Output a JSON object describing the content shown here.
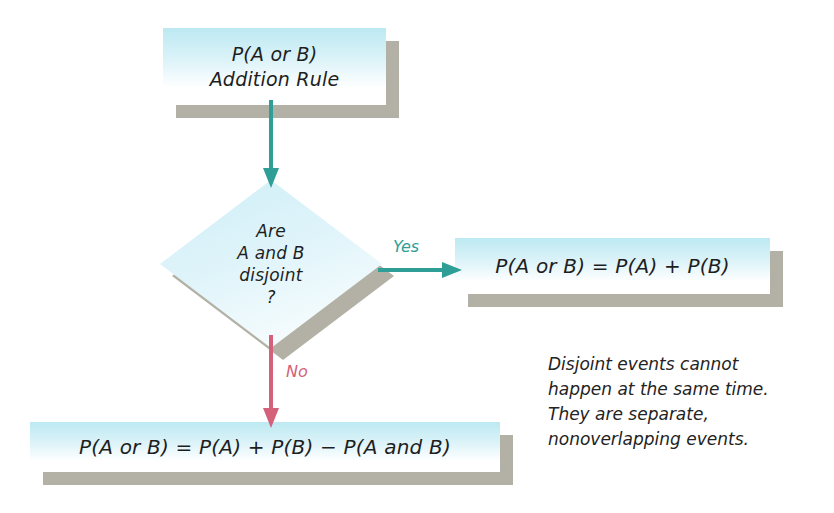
{
  "diagram": {
    "colors": {
      "node_fill_top": "#bde9f2",
      "node_fill_bottom": "#ffffff",
      "shadow": "#b3b1a6",
      "arrow_yes": "#2f9e96",
      "arrow_no": "#d4607a",
      "text": "#1e1e1e",
      "background": "#ffffff"
    },
    "nodes": {
      "start": {
        "shape": "rectangle",
        "lines": [
          "P(A or B)",
          "Addition Rule"
        ]
      },
      "decision": {
        "shape": "diamond",
        "lines": [
          "Are",
          "A and B",
          "disjoint",
          "?"
        ]
      },
      "yes_result": {
        "shape": "rectangle",
        "lines": [
          "P(A or B) = P(A) + P(B)"
        ]
      },
      "no_result": {
        "shape": "rectangle",
        "lines": [
          "P(A or B) = P(A) + P(B) − P(A and B)"
        ]
      }
    },
    "edges": {
      "start_to_decision": {
        "label": "",
        "direction": "down",
        "color": "#2f9e96"
      },
      "decision_to_yes": {
        "label": "Yes",
        "direction": "right",
        "color": "#2f9e96"
      },
      "decision_to_no": {
        "label": "No",
        "direction": "down",
        "color": "#d4607a"
      }
    },
    "annotation": {
      "lines": [
        "Disjoint events cannot",
        "happen at the same time.",
        "They are separate,",
        "nonoverlapping events."
      ]
    }
  }
}
